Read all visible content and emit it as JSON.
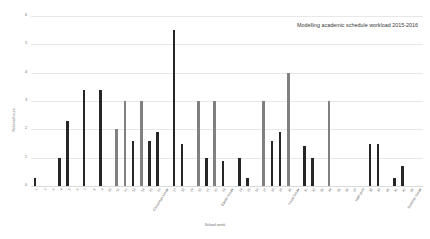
{
  "chart_data": {
    "type": "bar",
    "title": "Modelling academic schedule workload 2015-2016",
    "xlabel": "School week",
    "ylabel": "Notional hours",
    "ylim": [
      0,
      6
    ],
    "yticks": [
      0,
      1,
      2,
      3,
      4,
      5,
      6
    ],
    "grid": true,
    "legend": "none",
    "colors": {
      "dark": "#262626",
      "gray": "#808080",
      "gridline": "#e8e8e8",
      "axis_text": "#6f6f6f",
      "title_text": "#3a3a3a"
    },
    "categories": [
      "1",
      "2",
      "3",
      "4",
      "5",
      "6",
      "7",
      "8",
      "9",
      "10",
      "11",
      "12",
      "13",
      "14",
      "15",
      "16",
      "Christmas break",
      "17",
      "18",
      "19",
      "20",
      "21",
      "22",
      "23",
      "Easter break",
      "24",
      "25",
      "26",
      "27",
      "28",
      "29",
      "30",
      "Local break",
      "31",
      "32",
      "33",
      "34",
      "35",
      "36",
      "37",
      "Half term",
      "38",
      "39",
      "40",
      "41",
      "42",
      "43",
      "Summer break"
    ],
    "values": [
      0.3,
      0,
      0,
      1.0,
      2.3,
      0,
      3.4,
      0,
      3.4,
      0,
      2.0,
      3.0,
      1.6,
      3.0,
      1.6,
      1.9,
      0,
      5.5,
      1.5,
      0,
      3.0,
      1.0,
      3.0,
      0.9,
      0,
      1.0,
      0.3,
      0,
      3.0,
      1.6,
      1.9,
      4.0,
      0,
      1.4,
      1.0,
      0,
      3.0,
      0,
      0,
      0,
      0,
      1.5,
      1.5,
      0,
      0.3,
      0.7,
      0,
      0
    ],
    "bar_colors": [
      "dark",
      "dark",
      "dark",
      "dark",
      "dark",
      "dark",
      "dark",
      "dark",
      "dark",
      "dark",
      "gray",
      "gray",
      "dark",
      "gray",
      "dark",
      "dark",
      "dark",
      "dark",
      "dark",
      "dark",
      "gray",
      "dark",
      "gray",
      "dark",
      "dark",
      "dark",
      "dark",
      "dark",
      "gray",
      "dark",
      "dark",
      "gray",
      "dark",
      "dark",
      "dark",
      "dark",
      "gray",
      "dark",
      "dark",
      "dark",
      "dark",
      "dark",
      "dark",
      "dark",
      "dark",
      "dark",
      "dark",
      "dark"
    ]
  }
}
